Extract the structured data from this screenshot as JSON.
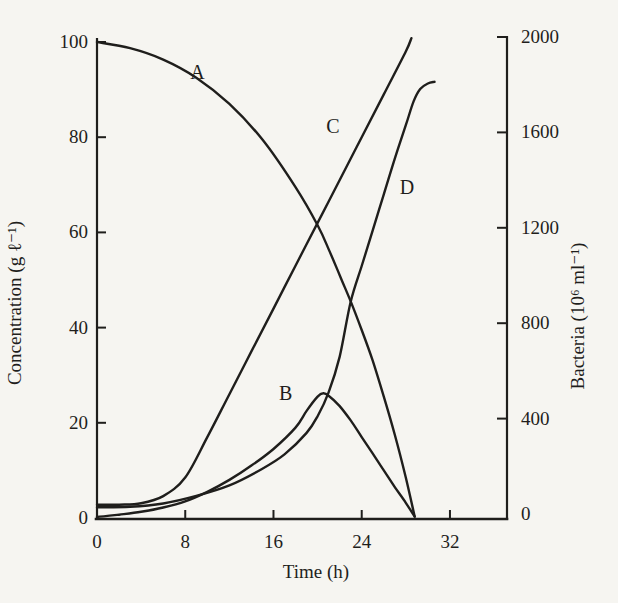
{
  "figure": {
    "background": "#f6f5f1",
    "ink": "#1f1e1c"
  },
  "chart_data": {
    "type": "line",
    "title": "",
    "xlabel": "Time (h)",
    "ylabel_left": "Concentration (g ℓ⁻¹)",
    "ylabel_right": "Bacteria (10⁶ ml⁻¹)",
    "x_ticks": [
      0,
      8,
      16,
      24,
      32
    ],
    "xlim": [
      0,
      37
    ],
    "left_ticks": [
      0,
      20,
      40,
      60,
      80,
      100
    ],
    "left_lim": [
      0,
      100
    ],
    "right_ticks": [
      0,
      400,
      800,
      1200,
      1600,
      2000
    ],
    "right_lim": [
      0,
      2000
    ],
    "grid": false,
    "legend": "curve letters placed beside lines",
    "series": [
      {
        "name": "A",
        "axis": "left",
        "description": "substrate concentration, falls from 100 to 0",
        "points": [
          [
            0,
            100
          ],
          [
            3,
            98.7
          ],
          [
            6,
            96.3
          ],
          [
            9,
            92.5
          ],
          [
            12,
            87
          ],
          [
            15,
            79.5
          ],
          [
            18,
            69.5
          ],
          [
            20,
            61.5
          ],
          [
            21,
            56.5
          ],
          [
            22,
            51
          ],
          [
            23,
            45.5
          ],
          [
            24,
            39.5
          ],
          [
            25,
            33
          ],
          [
            26,
            25.5
          ],
          [
            27,
            17.5
          ],
          [
            28,
            8.5
          ],
          [
            28.8,
            0.3
          ]
        ]
      },
      {
        "name": "B",
        "axis": "left",
        "description": "intermediate, peaks ~26 g/l at ~20.5 h then falls to 0",
        "points": [
          [
            0,
            0.2
          ],
          [
            2,
            0.7
          ],
          [
            4,
            1.3
          ],
          [
            6,
            2.2
          ],
          [
            8,
            3.5
          ],
          [
            10,
            5.5
          ],
          [
            12,
            8
          ],
          [
            14,
            11
          ],
          [
            16,
            14.5
          ],
          [
            18,
            19
          ],
          [
            19,
            22.5
          ],
          [
            20,
            25.5
          ],
          [
            20.5,
            26.2
          ],
          [
            21,
            25.7
          ],
          [
            22,
            23.5
          ],
          [
            23,
            20.5
          ],
          [
            24,
            17
          ],
          [
            25,
            13.5
          ],
          [
            26,
            10
          ],
          [
            27,
            6.5
          ],
          [
            28,
            3.2
          ],
          [
            28.8,
            0.3
          ]
        ]
      },
      {
        "name": "C",
        "axis": "left",
        "description": "product, near-linear rise to ~101 g/l at ~28.5 h",
        "points": [
          [
            0,
            2.8
          ],
          [
            2,
            2.8
          ],
          [
            4,
            3.1
          ],
          [
            6,
            4.6
          ],
          [
            8,
            8.5
          ],
          [
            10,
            17
          ],
          [
            12,
            26
          ],
          [
            14,
            35
          ],
          [
            16,
            44
          ],
          [
            18,
            53
          ],
          [
            20,
            62
          ],
          [
            22,
            71
          ],
          [
            24,
            80
          ],
          [
            26,
            89
          ],
          [
            28,
            98
          ],
          [
            28.5,
            100.8
          ]
        ]
      },
      {
        "name": "D",
        "axis": "right",
        "description": "bacteria count (10^6 per ml), sigmoid rise to plateau ~1810",
        "points": [
          [
            0,
            28
          ],
          [
            3,
            30
          ],
          [
            6,
            44
          ],
          [
            9,
            76
          ],
          [
            12,
            120
          ],
          [
            15,
            190
          ],
          [
            17,
            250
          ],
          [
            19,
            340
          ],
          [
            20,
            410
          ],
          [
            21,
            510
          ],
          [
            22,
            660
          ],
          [
            23,
            890
          ],
          [
            24,
            1040
          ],
          [
            25,
            1190
          ],
          [
            26,
            1340
          ],
          [
            27,
            1490
          ],
          [
            28,
            1630
          ],
          [
            28.7,
            1730
          ],
          [
            29.3,
            1782
          ],
          [
            30,
            1805
          ],
          [
            30.6,
            1812
          ]
        ]
      }
    ],
    "curve_labels": [
      {
        "name": "A",
        "t": 9.1,
        "v": 93.7,
        "axis": "left"
      },
      {
        "name": "B",
        "t": 17.1,
        "v": 26.3,
        "axis": "left"
      },
      {
        "name": "C",
        "t": 21.4,
        "v": 82.4,
        "axis": "left"
      },
      {
        "name": "D",
        "t": 28.1,
        "v": 1371,
        "axis": "right"
      }
    ]
  }
}
